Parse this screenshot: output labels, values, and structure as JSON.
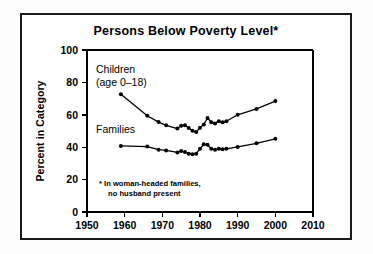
{
  "figure": {
    "title": "Persons Below Poverty Level*",
    "footnote_line1": "* In woman-headed families,",
    "footnote_line2": "no husband present",
    "ink_color": "#000000",
    "background_color": "#ffffff"
  },
  "labels": {
    "children_line1": "Children",
    "children_line2": "(age 0–18)",
    "families": "Families"
  },
  "chart_data": {
    "type": "line",
    "title": "Persons Below Poverty Level*",
    "xlabel": "",
    "ylabel": "Percent in Category",
    "xlim": [
      1950,
      2010
    ],
    "ylim": [
      0,
      100
    ],
    "xticks": [
      1950,
      1960,
      1970,
      1980,
      1990,
      2000,
      2010
    ],
    "xtick_labels": [
      "1950",
      "1960",
      "1970",
      "1980",
      "1990",
      "2000",
      "2010"
    ],
    "yticks": [
      0,
      20,
      40,
      60,
      80,
      100
    ],
    "ytick_labels": [
      "0",
      "20",
      "40",
      "60",
      "80",
      "100"
    ],
    "grid": false,
    "legend": "inline-annotations",
    "annotations": [
      {
        "text": "Children\n(age 0–18)",
        "x": 1959,
        "y": 84
      },
      {
        "text": "Families",
        "x": 1959,
        "y": 48
      },
      {
        "text": "* In woman-headed families,\nno husband present",
        "x": 1960,
        "y": 13
      }
    ],
    "series": [
      {
        "name": "Children (age 0-18)",
        "x": [
          1959,
          1966,
          1969,
          1971,
          1974,
          1975,
          1976,
          1977,
          1978,
          1979,
          1980,
          1981,
          1982,
          1983,
          1984,
          1985,
          1986,
          1987,
          1990,
          1995,
          2000
        ],
        "values": [
          72.7,
          59.4,
          55.5,
          53.5,
          51.5,
          53.2,
          53.5,
          51.8,
          50.1,
          49.4,
          52.0,
          54.0,
          58.0,
          55.4,
          54.7,
          56.0,
          55.4,
          56.0,
          60.0,
          63.6,
          68.5
        ]
      },
      {
        "name": "Families",
        "x": [
          1959,
          1966,
          1969,
          1971,
          1974,
          1975,
          1976,
          1977,
          1978,
          1979,
          1980,
          1981,
          1982,
          1983,
          1984,
          1985,
          1986,
          1987,
          1990,
          1995,
          2000
        ],
        "values": [
          40.8,
          40.4,
          38.5,
          38.0,
          36.8,
          37.6,
          37.0,
          36.0,
          35.6,
          36.0,
          39.0,
          41.8,
          41.5,
          39.0,
          38.4,
          39.0,
          38.8,
          39.0,
          40.2,
          42.4,
          45.2
        ]
      }
    ]
  },
  "geometry": {
    "plot_left": 87,
    "plot_right": 313,
    "plot_top": 50,
    "plot_bottom": 212
  }
}
